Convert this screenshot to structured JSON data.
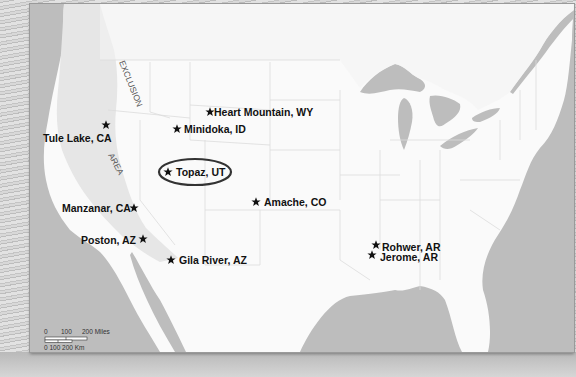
{
  "map": {
    "exclusion_zone_label": [
      "EXCLUSION",
      "AREA"
    ],
    "highlighted_camp": "Topaz, UT",
    "camps": [
      {
        "name": "Heart Mountain, WY",
        "label_side": "right"
      },
      {
        "name": "Minidoka, ID",
        "label_side": "right"
      },
      {
        "name": "Tule Lake, CA",
        "label_side": "below-left"
      },
      {
        "name": "Topaz, UT",
        "label_side": "right",
        "highlighted": true
      },
      {
        "name": "Amache, CO",
        "label_side": "right"
      },
      {
        "name": "Manzanar, CA",
        "label_side": "left"
      },
      {
        "name": "Poston, AZ",
        "label_side": "left"
      },
      {
        "name": "Gila River, AZ",
        "label_side": "right"
      },
      {
        "name": "Rohwer, AR",
        "label_side": "right"
      },
      {
        "name": "Jerome, AR",
        "label_side": "right"
      }
    ],
    "scale_bar": {
      "miles_labels": [
        "0",
        "100",
        "200 Miles"
      ],
      "km_labels": "0 100 200 Km"
    },
    "colors": {
      "water": "#bdbdbd",
      "land": "#fafafa",
      "exclusion_area": "#e6e6e6",
      "marker": "#111111",
      "highlight_ring": "#333333"
    }
  }
}
